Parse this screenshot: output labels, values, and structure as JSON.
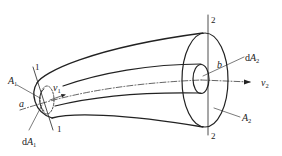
{
  "figure": {
    "type": "stream tube diagram",
    "labels": {
      "section_1_top": "1",
      "section_1_bottom": "1",
      "section_2_top": "2",
      "section_2_bottom": "2",
      "area_1": "A",
      "area_1_sub": "1",
      "d_area_1_prefix": "d",
      "d_area_1": "A",
      "d_area_1_sub": "1",
      "velocity_1": "v",
      "velocity_1_sub": "1",
      "point_a": "a",
      "point_b": "b",
      "d_area_2_prefix": "d",
      "d_area_2": "A",
      "d_area_2_sub": "2",
      "velocity_2": "v",
      "velocity_2_sub": "2",
      "area_2": "A",
      "area_2_sub": "2"
    },
    "colors": {
      "stroke": "#222222",
      "background": "#ffffff"
    }
  }
}
